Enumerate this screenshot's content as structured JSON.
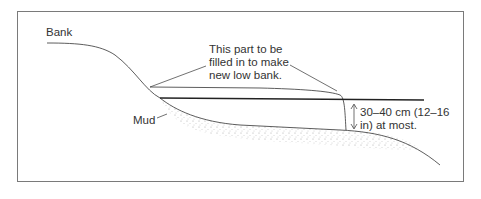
{
  "diagram": {
    "labels": {
      "bank": "Bank",
      "mud": "Mud",
      "fill_line1": "This part to be",
      "fill_line2": "filled in to make",
      "fill_line3": "new low bank.",
      "depth_line1": "30–40 cm (12–16",
      "depth_line2": "in) at most."
    },
    "colors": {
      "line": "#333333",
      "frame": "#7a7a7a",
      "stipple": "#999999"
    }
  }
}
